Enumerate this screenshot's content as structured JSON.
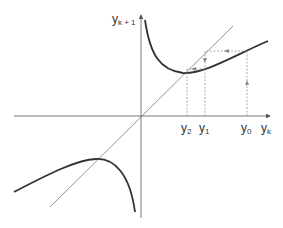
{
  "diagram": {
    "type": "cobweb-iteration",
    "axes": {
      "x_label": "y",
      "x_sub": "k",
      "y_label": "y",
      "y_sub": "k + 1"
    },
    "points": [
      {
        "label": "y",
        "sub": "2"
      },
      {
        "label": "y",
        "sub": "1"
      },
      {
        "label": "y",
        "sub": "0"
      }
    ],
    "colors": {
      "curve": "#333333",
      "diagonal": "#777777",
      "axis": "#555555",
      "cobweb": "#888888"
    }
  }
}
